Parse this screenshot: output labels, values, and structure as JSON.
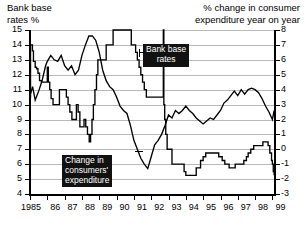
{
  "titles": {
    "left": "Bank base\nrates %",
    "right": "% change in consumer\nexpenditure year on year"
  },
  "callouts": {
    "bank": "Bank base\nrates",
    "consumers": "Change in\nconsumers'\nexpenditure"
  },
  "chart_data": {
    "type": "line",
    "title": "",
    "xlabel": "",
    "grid": true,
    "legend": "inline-callouts",
    "x_ticks": [
      "1985",
      "86",
      "87",
      "88",
      "89",
      "90",
      "91",
      "92",
      "93",
      "94",
      "95",
      "96",
      "97",
      "98",
      "99"
    ],
    "axes": {
      "left": {
        "label": "Bank base rates %",
        "ylim": [
          4,
          15
        ],
        "ticks": [
          4,
          5,
          6,
          7,
          8,
          9,
          10,
          11,
          12,
          13,
          14,
          15
        ]
      },
      "right": {
        "label": "% change in consumer expenditure year on year",
        "ylim": [
          -3,
          8
        ],
        "ticks": [
          -3,
          -2,
          -1,
          0,
          1,
          2,
          3,
          4,
          5,
          6,
          7,
          8
        ]
      }
    },
    "series": [
      {
        "name": "Bank base rates",
        "axis": "left",
        "unit": "%",
        "style": "step",
        "points": [
          [
            1985.0,
            10.5
          ],
          [
            1985.03,
            14.0
          ],
          [
            1985.1,
            14.0
          ],
          [
            1985.14,
            13.6
          ],
          [
            1985.2,
            12.9
          ],
          [
            1985.3,
            12.5
          ],
          [
            1985.38,
            12.4
          ],
          [
            1985.46,
            12.1
          ],
          [
            1985.55,
            11.6
          ],
          [
            1985.66,
            11.5
          ],
          [
            1985.78,
            11.5
          ],
          [
            1985.88,
            11.5
          ],
          [
            1986.0,
            12.5
          ],
          [
            1986.06,
            11.5
          ],
          [
            1986.14,
            11.0
          ],
          [
            1986.22,
            10.4
          ],
          [
            1986.33,
            10.0
          ],
          [
            1986.45,
            10.0
          ],
          [
            1986.58,
            10.0
          ],
          [
            1986.7,
            11.0
          ],
          [
            1986.8,
            11.0
          ],
          [
            1986.92,
            11.0
          ],
          [
            1987.0,
            11.0
          ],
          [
            1987.1,
            10.5
          ],
          [
            1987.2,
            10.0
          ],
          [
            1987.3,
            9.5
          ],
          [
            1987.42,
            9.0
          ],
          [
            1987.55,
            9.0
          ],
          [
            1987.68,
            10.0
          ],
          [
            1987.78,
            9.5
          ],
          [
            1987.88,
            8.5
          ],
          [
            1988.0,
            8.5
          ],
          [
            1988.12,
            9.0
          ],
          [
            1988.22,
            8.5
          ],
          [
            1988.32,
            8.0
          ],
          [
            1988.42,
            7.5
          ],
          [
            1988.5,
            8.0
          ],
          [
            1988.58,
            9.0
          ],
          [
            1988.66,
            10.0
          ],
          [
            1988.75,
            11.0
          ],
          [
            1988.84,
            12.0
          ],
          [
            1988.92,
            13.0
          ],
          [
            1989.0,
            13.0
          ],
          [
            1989.2,
            13.0
          ],
          [
            1989.4,
            14.0
          ],
          [
            1989.6,
            14.0
          ],
          [
            1989.8,
            15.0
          ],
          [
            1990.0,
            15.0
          ],
          [
            1990.3,
            15.0
          ],
          [
            1990.6,
            15.0
          ],
          [
            1990.8,
            15.0
          ],
          [
            1990.85,
            14.0
          ],
          [
            1991.0,
            14.0
          ],
          [
            1991.1,
            13.5
          ],
          [
            1991.2,
            13.0
          ],
          [
            1991.3,
            12.5
          ],
          [
            1991.4,
            12.0
          ],
          [
            1991.5,
            11.5
          ],
          [
            1991.6,
            11.0
          ],
          [
            1991.72,
            10.5
          ],
          [
            1991.85,
            10.5
          ],
          [
            1992.0,
            10.5
          ],
          [
            1992.2,
            10.5
          ],
          [
            1992.55,
            10.5
          ],
          [
            1992.7,
            15.0
          ],
          [
            1992.73,
            10.0
          ],
          [
            1992.78,
            9.0
          ],
          [
            1992.84,
            8.0
          ],
          [
            1992.92,
            7.0
          ],
          [
            1993.0,
            7.0
          ],
          [
            1993.2,
            6.0
          ],
          [
            1993.5,
            6.0
          ],
          [
            1993.9,
            5.5
          ],
          [
            1994.0,
            5.25
          ],
          [
            1994.3,
            5.25
          ],
          [
            1994.6,
            5.75
          ],
          [
            1994.85,
            6.25
          ],
          [
            1995.0,
            6.5
          ],
          [
            1995.15,
            6.75
          ],
          [
            1995.5,
            6.75
          ],
          [
            1995.9,
            6.5
          ],
          [
            1996.1,
            6.25
          ],
          [
            1996.25,
            6.0
          ],
          [
            1996.5,
            5.75
          ],
          [
            1996.7,
            5.75
          ],
          [
            1996.85,
            6.0
          ],
          [
            1997.0,
            6.0
          ],
          [
            1997.35,
            6.25
          ],
          [
            1997.5,
            6.5
          ],
          [
            1997.6,
            6.75
          ],
          [
            1997.75,
            7.0
          ],
          [
            1997.92,
            7.25
          ],
          [
            1998.0,
            7.25
          ],
          [
            1998.45,
            7.5
          ],
          [
            1998.75,
            7.25
          ],
          [
            1998.85,
            6.75
          ],
          [
            1998.95,
            6.25
          ],
          [
            1999.0,
            6.0
          ],
          [
            1999.05,
            5.5
          ],
          [
            1999.1,
            5.25
          ]
        ]
      },
      {
        "name": "Change in consumers' expenditure",
        "axis": "right",
        "unit": "%",
        "style": "line",
        "points": [
          [
            1985.0,
            3.6
          ],
          [
            1985.15,
            4.2
          ],
          [
            1985.3,
            3.3
          ],
          [
            1985.5,
            3.9
          ],
          [
            1985.7,
            4.6
          ],
          [
            1985.9,
            5.6
          ],
          [
            1986.0,
            5.9
          ],
          [
            1986.2,
            6.3
          ],
          [
            1986.4,
            6.0
          ],
          [
            1986.6,
            5.9
          ],
          [
            1986.8,
            6.3
          ],
          [
            1987.0,
            5.6
          ],
          [
            1987.2,
            5.3
          ],
          [
            1987.4,
            5.6
          ],
          [
            1987.6,
            5.0
          ],
          [
            1987.8,
            5.3
          ],
          [
            1988.0,
            6.3
          ],
          [
            1988.2,
            7.0
          ],
          [
            1988.4,
            7.6
          ],
          [
            1988.6,
            7.6
          ],
          [
            1988.8,
            7.3
          ],
          [
            1989.0,
            6.5
          ],
          [
            1989.2,
            5.3
          ],
          [
            1989.4,
            4.6
          ],
          [
            1989.6,
            4.2
          ],
          [
            1989.8,
            4.0
          ],
          [
            1990.0,
            3.5
          ],
          [
            1990.2,
            2.9
          ],
          [
            1990.4,
            2.6
          ],
          [
            1990.6,
            2.4
          ],
          [
            1990.8,
            1.6
          ],
          [
            1991.0,
            0.6
          ],
          [
            1991.2,
            0.0
          ],
          [
            1991.4,
            -0.6
          ],
          [
            1991.6,
            -1.0
          ],
          [
            1991.8,
            -1.3
          ],
          [
            1992.0,
            -0.5
          ],
          [
            1992.2,
            0.3
          ],
          [
            1992.4,
            0.6
          ],
          [
            1992.6,
            1.0
          ],
          [
            1992.8,
            1.6
          ],
          [
            1993.0,
            2.3
          ],
          [
            1993.2,
            2.1
          ],
          [
            1993.4,
            2.6
          ],
          [
            1993.6,
            2.4
          ],
          [
            1993.8,
            2.6
          ],
          [
            1994.0,
            2.9
          ],
          [
            1994.2,
            2.6
          ],
          [
            1994.4,
            2.4
          ],
          [
            1994.6,
            2.1
          ],
          [
            1994.8,
            1.9
          ],
          [
            1995.0,
            1.7
          ],
          [
            1995.2,
            1.9
          ],
          [
            1995.4,
            2.1
          ],
          [
            1995.6,
            2.0
          ],
          [
            1995.8,
            2.3
          ],
          [
            1996.0,
            2.6
          ],
          [
            1996.2,
            3.1
          ],
          [
            1996.4,
            3.3
          ],
          [
            1996.6,
            3.6
          ],
          [
            1996.8,
            3.9
          ],
          [
            1997.0,
            3.6
          ],
          [
            1997.2,
            4.0
          ],
          [
            1997.4,
            3.7
          ],
          [
            1997.6,
            4.0
          ],
          [
            1997.8,
            4.1
          ],
          [
            1998.0,
            4.0
          ],
          [
            1998.2,
            3.8
          ],
          [
            1998.4,
            3.4
          ],
          [
            1998.6,
            2.9
          ],
          [
            1998.8,
            2.5
          ],
          [
            1999.0,
            2.0
          ],
          [
            1999.1,
            2.6
          ]
        ]
      }
    ]
  }
}
